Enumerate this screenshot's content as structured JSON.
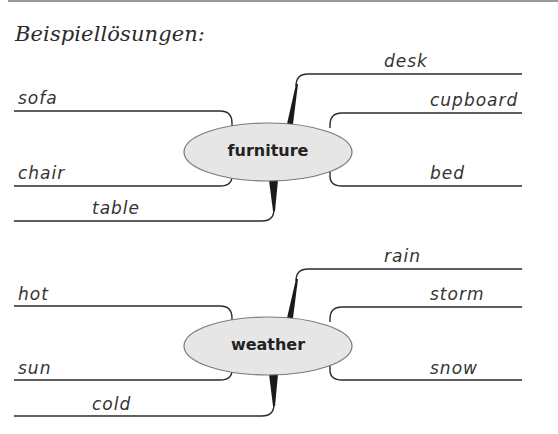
{
  "heading": "Beispiellösungen:",
  "mindmaps": [
    {
      "center": "furniture",
      "left": [
        "sofa",
        "chair",
        "table"
      ],
      "right": [
        "desk",
        "cupboard",
        "bed"
      ]
    },
    {
      "center": "weather",
      "left": [
        "hot",
        "sun",
        "cold"
      ],
      "right": [
        "rain",
        "storm",
        "snow"
      ]
    }
  ],
  "colors": {
    "line": "#2b2b2b",
    "ellipse_fill": "#e6e6e6",
    "ellipse_stroke": "#7a7a7a",
    "text": "#333333"
  }
}
